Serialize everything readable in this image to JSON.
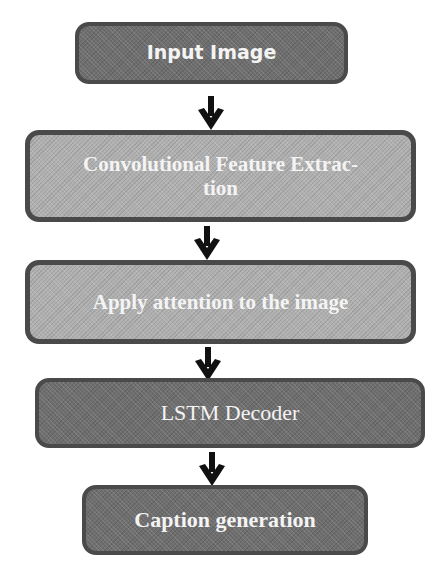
{
  "diagram": {
    "type": "flowchart",
    "direction": "top-to-bottom",
    "nodes": [
      {
        "id": "input",
        "label": "Input Image",
        "fill": "#6e6e6e",
        "style": "dark"
      },
      {
        "id": "conv",
        "label": "Convolutional Feature Extrac-tion",
        "line1": "Convolutional Feature Extrac-",
        "line2": "tion",
        "fill": "#b0b0b0",
        "style": "light"
      },
      {
        "id": "attention",
        "label": "Apply attention to the image",
        "fill": "#b0b0b0",
        "style": "light"
      },
      {
        "id": "lstm",
        "label": "LSTM Decoder",
        "fill": "#6e6e6e",
        "style": "dark"
      },
      {
        "id": "caption",
        "label": "Caption generation",
        "fill": "#6e6e6e",
        "style": "dark"
      }
    ],
    "edges": [
      {
        "from": "input",
        "to": "conv",
        "icon": "arrow-down-icon"
      },
      {
        "from": "conv",
        "to": "attention",
        "icon": "arrow-down-icon"
      },
      {
        "from": "attention",
        "to": "lstm",
        "icon": "arrow-down-icon"
      },
      {
        "from": "lstm",
        "to": "caption",
        "icon": "arrow-down-icon"
      }
    ],
    "colors": {
      "dark_fill": "#6e6e6e",
      "light_fill": "#b0b0b0",
      "border": "#4a4a4a",
      "text": "#f4f4f4",
      "arrow": "#111111"
    }
  }
}
